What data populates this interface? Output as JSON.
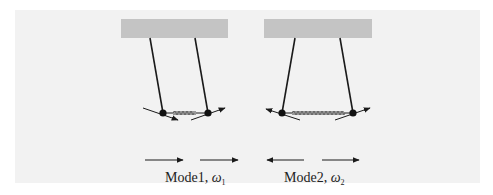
{
  "figure": {
    "background_color": "#f2f2f2",
    "support_color": "#c4c4c4",
    "line_color": "#1a1a1a",
    "spring_color": "#777777"
  },
  "modes": [
    {
      "id": "mode1",
      "label_prefix": "Mode1, ",
      "omega_symbol": "ω",
      "omega_subscript": "1",
      "bob_motion": [
        "right",
        "right"
      ],
      "bottom_arrows": [
        "right",
        "right"
      ],
      "description": "in-phase"
    },
    {
      "id": "mode2",
      "label_prefix": "Mode2, ",
      "omega_symbol": "ω",
      "omega_subscript": "2",
      "bob_motion": [
        "left",
        "right"
      ],
      "bottom_arrows": [
        "left",
        "right"
      ],
      "description": "out-of-phase"
    }
  ]
}
